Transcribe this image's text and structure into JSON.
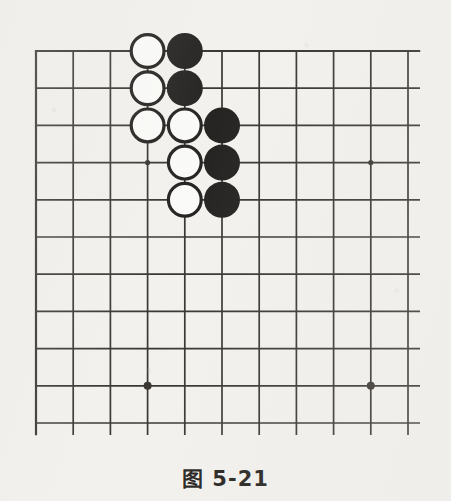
{
  "figure": {
    "caption": "图 5-21",
    "kind": "go-board-diagram"
  },
  "board": {
    "type": "go",
    "columns": 11,
    "rows": 11,
    "origin_x": 36,
    "origin_y": 51,
    "spacing": 37.2,
    "line_color": "#2b2823",
    "line_width": 1.7,
    "border_width": 2.2,
    "background_color": "#f2f1ee",
    "star_point_radius": 4.0,
    "star_point_radius_small": 2.6,
    "star_points": [
      {
        "col": 3,
        "row": 3,
        "size": "small"
      },
      {
        "col": 9,
        "row": 3,
        "size": "small"
      },
      {
        "col": 3,
        "row": 9,
        "size": "large"
      },
      {
        "col": 9,
        "row": 9,
        "size": "large"
      }
    ],
    "stone_radius": 18,
    "stone_outline_width": 3.2,
    "white_fill": "#fbfbf9",
    "black_fill": "#161412",
    "stone_outline_color": "#161412",
    "stones": [
      {
        "color": "white",
        "col": 3,
        "row": 0
      },
      {
        "color": "black",
        "col": 4,
        "row": 0
      },
      {
        "color": "white",
        "col": 3,
        "row": 1
      },
      {
        "color": "black",
        "col": 4,
        "row": 1
      },
      {
        "color": "white",
        "col": 3,
        "row": 2
      },
      {
        "color": "white",
        "col": 4,
        "row": 2
      },
      {
        "color": "black",
        "col": 5,
        "row": 2
      },
      {
        "color": "white",
        "col": 4,
        "row": 3
      },
      {
        "color": "black",
        "col": 5,
        "row": 3
      },
      {
        "color": "white",
        "col": 4,
        "row": 4
      },
      {
        "color": "black",
        "col": 5,
        "row": 4
      }
    ]
  }
}
